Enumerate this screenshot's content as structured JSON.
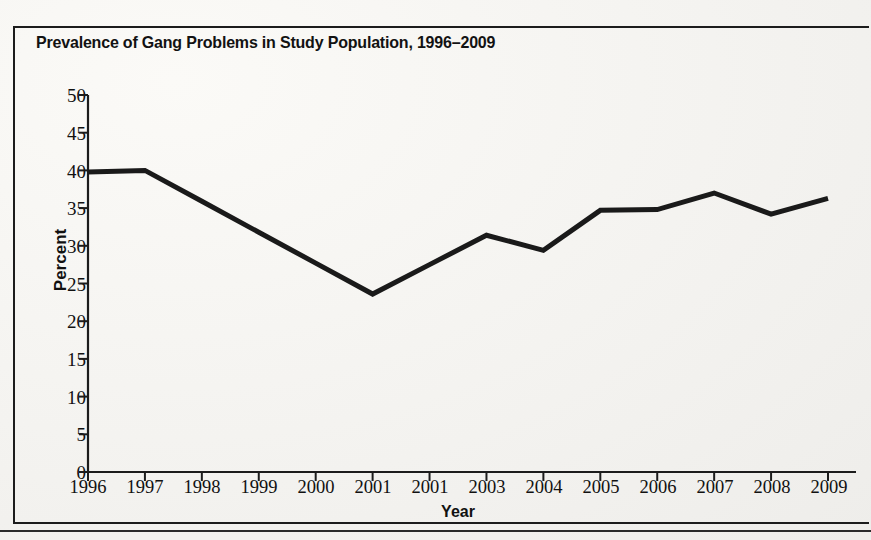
{
  "figure": {
    "title": "Prevalence of Gang Problems in Study Population, 1996–2009"
  },
  "chart_data": {
    "type": "line",
    "title": "Prevalence of Gang Problems in Study Population, 1996–2009",
    "xlabel": "Year",
    "ylabel": "Percent",
    "categories": [
      "1996",
      "1997",
      "1998",
      "1999",
      "2000",
      "2001",
      "2001",
      "2003",
      "2004",
      "2005",
      "2006",
      "2007",
      "2008",
      "2009"
    ],
    "values": [
      39.8,
      40.0,
      35.9,
      31.8,
      27.7,
      23.6,
      27.5,
      31.4,
      29.4,
      34.7,
      34.8,
      37.0,
      34.2,
      36.3
    ],
    "series": [
      {
        "name": "Percent with gang problems",
        "values": [
          39.8,
          40.0,
          35.9,
          31.8,
          27.7,
          23.6,
          27.5,
          31.4,
          29.4,
          34.7,
          34.8,
          37.0,
          34.2,
          36.3
        ]
      }
    ],
    "ylim": [
      0,
      50
    ],
    "ytick_labels": [
      "50",
      "45",
      "40",
      "35",
      "30",
      "25",
      "20",
      "15",
      "10",
      "5",
      "0"
    ],
    "ytick_values": [
      50,
      45,
      40,
      35,
      30,
      25,
      20,
      15,
      10,
      5,
      0
    ],
    "grid": false,
    "legend": false,
    "legend_position": "none",
    "line_color": "#1a1a1a",
    "line_width": 5,
    "markers": false
  },
  "colors": {
    "line": "#1a1a1a",
    "axis": "#1c1c1c",
    "text": "#111111",
    "page_background": "#f2f1ee"
  }
}
